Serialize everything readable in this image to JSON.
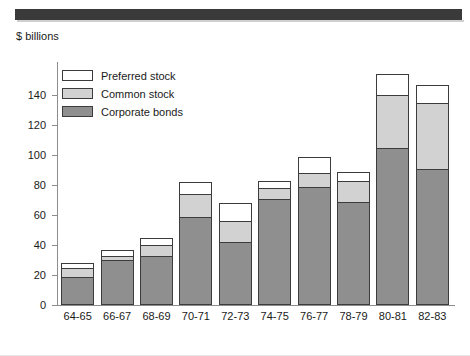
{
  "chart_data": {
    "type": "bar",
    "subtype": "stacked",
    "title": "",
    "xlabel": "",
    "ylabel": "$ billions",
    "ylim": [
      0,
      150
    ],
    "yticks": [
      0,
      20,
      40,
      60,
      80,
      100,
      120,
      140
    ],
    "grid": false,
    "legend_position": "upper-left-inside",
    "categories": [
      "64-65",
      "66-67",
      "68-69",
      "70-71",
      "72-73",
      "74-75",
      "76-77",
      "78-79",
      "80-81",
      "82-83"
    ],
    "series": [
      {
        "name": "Corporate bonds",
        "color": "#8f8f8f",
        "values": [
          19,
          30,
          33,
          59,
          42,
          71,
          79,
          69,
          105,
          91
        ]
      },
      {
        "name": "Common stock",
        "color": "#d2d2d2",
        "values": [
          6,
          3,
          7,
          15,
          14,
          7,
          9,
          14,
          35,
          44
        ]
      },
      {
        "name": "Preferred stock",
        "color": "#ffffff",
        "values": [
          3,
          4,
          5,
          8,
          12,
          5,
          11,
          6,
          14,
          12
        ]
      }
    ],
    "totals": [
      28,
      37,
      45,
      82,
      68,
      83,
      99,
      89,
      154,
      147
    ]
  },
  "axis": {
    "y_title": "$ billions",
    "y_tick_labels": [
      "140",
      "120",
      "100",
      "80",
      "60",
      "40",
      "20",
      "0"
    ],
    "x_tick_labels": [
      "64-65",
      "66-67",
      "68-69",
      "70-71",
      "72-73",
      "74-75",
      "76-77",
      "78-79",
      "80-81",
      "82-83"
    ]
  },
  "legend": {
    "items": [
      {
        "label": "Preferred stock",
        "color": "#ffffff"
      },
      {
        "label": "Common stock",
        "color": "#d2d2d2"
      },
      {
        "label": "Corporate bonds",
        "color": "#8f8f8f"
      }
    ]
  },
  "colors": {
    "preferred_stock": "#ffffff",
    "common_stock": "#d2d2d2",
    "corporate_bonds": "#8f8f8f",
    "outline": "#3c3c3c",
    "axis": "#8d8d8d",
    "top_rule": "#3a3a3a",
    "text": "#1a1a1a"
  }
}
